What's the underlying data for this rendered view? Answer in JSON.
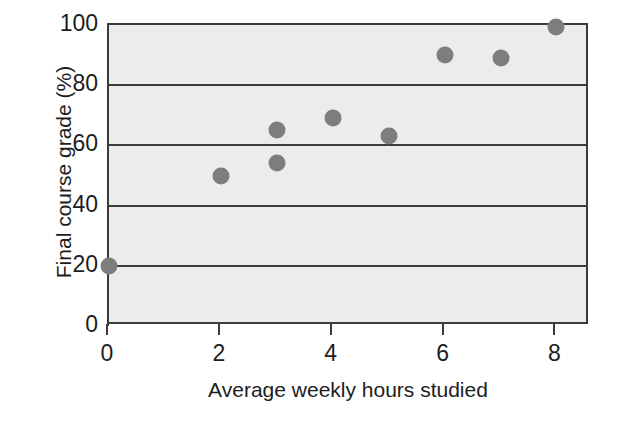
{
  "chart_data": {
    "type": "scatter",
    "title": "",
    "xlabel": "Average weekly hours studied",
    "ylabel": "Final course grade (%)",
    "xlim": [
      0,
      8.6
    ],
    "ylim": [
      0,
      100
    ],
    "xticks": [
      0,
      2,
      4,
      6,
      8
    ],
    "xtick_labels": [
      "0",
      "2",
      "4",
      "6",
      "8"
    ],
    "yticks": [
      0,
      20,
      40,
      60,
      80,
      100
    ],
    "ytick_labels": [
      "0",
      "20",
      "40",
      "60",
      "80",
      "100"
    ],
    "grid": "horizontal",
    "legend": "none",
    "marker_color": "#7d7d7d",
    "plot_background": "#ececec",
    "axis_color": "#3b3b3b",
    "points": [
      {
        "x": 0,
        "y": 20
      },
      {
        "x": 2,
        "y": 50
      },
      {
        "x": 3,
        "y": 65
      },
      {
        "x": 3,
        "y": 54
      },
      {
        "x": 4,
        "y": 69
      },
      {
        "x": 5,
        "y": 63
      },
      {
        "x": 6,
        "y": 90
      },
      {
        "x": 7,
        "y": 89
      },
      {
        "x": 8,
        "y": 99.5
      }
    ]
  }
}
